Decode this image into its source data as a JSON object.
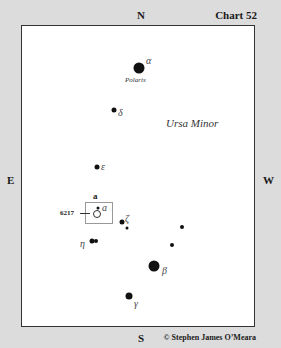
{
  "chart": {
    "number_label": "Chart 52",
    "copyright": "© Stephen James O’Meara",
    "directions": {
      "north": "N",
      "south": "S",
      "east": "E",
      "west": "W"
    },
    "constellation": "Ursa Minor"
  },
  "stars": [
    {
      "id": "alpha",
      "greek": "α",
      "name": "Polaris",
      "x": 139,
      "y": 68,
      "size": 11
    },
    {
      "id": "delta",
      "greek": "δ",
      "x": 114,
      "y": 110,
      "size": 5
    },
    {
      "id": "epsilon",
      "greek": "ε",
      "x": 97,
      "y": 167,
      "size": 5
    },
    {
      "id": "zeta",
      "greek": "ζ",
      "x": 122,
      "y": 222,
      "size": 5
    },
    {
      "id": "eta",
      "greek": "η",
      "x": 93,
      "y": 241,
      "size": 5
    },
    {
      "id": "beta",
      "greek": "β",
      "x": 154,
      "y": 266,
      "size": 11
    },
    {
      "id": "gamma",
      "greek": "γ",
      "x": 129,
      "y": 296,
      "size": 7
    },
    {
      "id": "unnamed-1",
      "x": 182,
      "y": 227,
      "size": 4
    },
    {
      "id": "unnamed-2",
      "x": 172,
      "y": 245,
      "size": 4
    }
  ],
  "field": {
    "label": "a",
    "object_id": "6217",
    "object_greek": "a"
  }
}
